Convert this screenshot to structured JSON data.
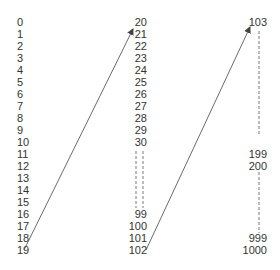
{
  "diagram": {
    "columns": [
      {
        "id": "left",
        "labels": [
          "0",
          "1",
          "2",
          "3",
          "4",
          "5",
          "6",
          "7",
          "8",
          "9",
          "10",
          "11",
          "12",
          "13",
          "14",
          "15",
          "16",
          "17",
          "18",
          "19"
        ],
        "row_indices": [
          0,
          1,
          2,
          3,
          4,
          5,
          6,
          7,
          8,
          9,
          10,
          11,
          12,
          13,
          14,
          15,
          16,
          17,
          18,
          19
        ]
      },
      {
        "id": "middle",
        "labels": [
          "20",
          "21",
          "22",
          "23",
          "24",
          "25",
          "26",
          "27",
          "28",
          "29",
          "30",
          "99",
          "100",
          "101",
          "102"
        ],
        "row_indices": [
          0,
          1,
          2,
          3,
          4,
          5,
          6,
          7,
          8,
          9,
          10,
          16,
          17,
          18,
          19
        ],
        "gap": {
          "between": [
            "30",
            "99"
          ],
          "style": "double-dashed-vertical"
        }
      },
      {
        "id": "right",
        "labels": [
          "103",
          "199",
          "200",
          "999",
          "1000"
        ],
        "row_indices": [
          0,
          11,
          12,
          18,
          19
        ],
        "gaps": [
          {
            "between": [
              "103",
              "199"
            ],
            "style": "dashed-vertical"
          },
          {
            "between": [
              "200",
              "999"
            ],
            "style": "dashed-vertical"
          }
        ]
      }
    ],
    "arrows": [
      {
        "from": "19",
        "to": "20",
        "style": "solid-with-arrowhead"
      },
      {
        "from": "102",
        "to": "103",
        "style": "solid-with-arrowhead"
      }
    ],
    "colors": {
      "text": "#333333",
      "line": "#444444",
      "background": "#ffffff"
    }
  }
}
